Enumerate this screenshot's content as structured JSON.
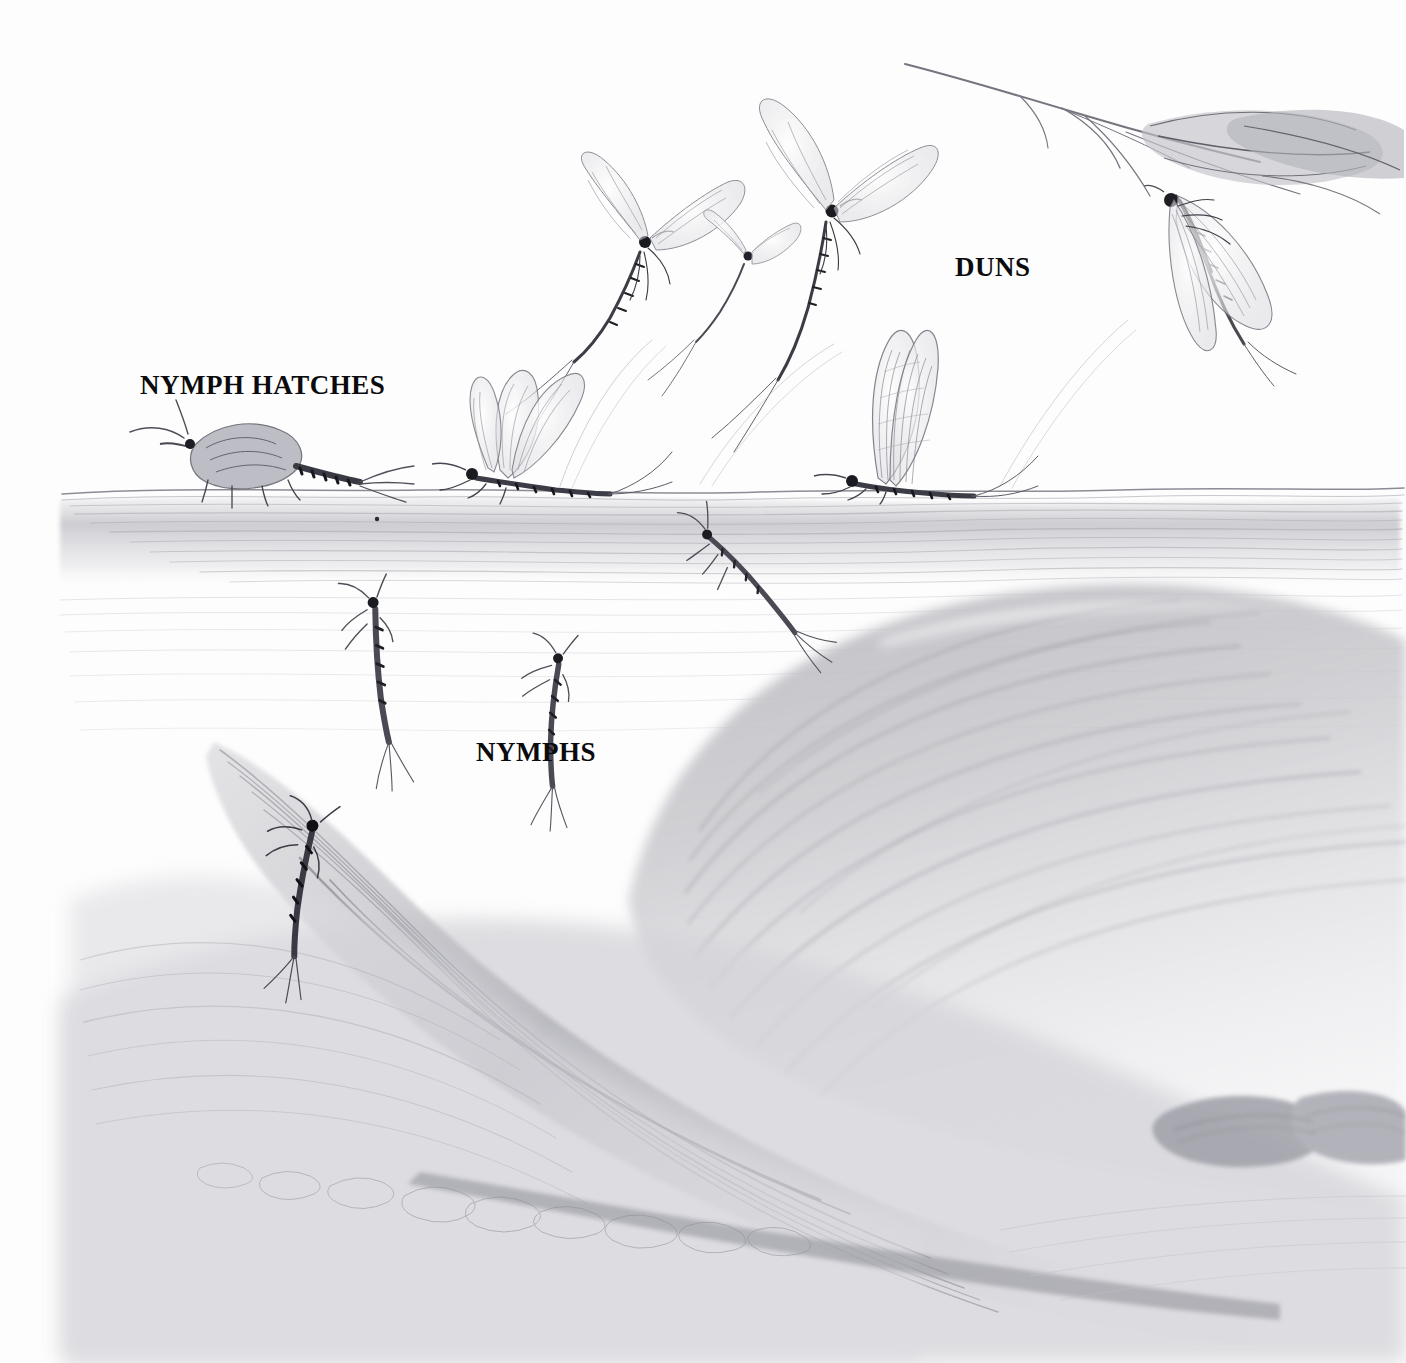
{
  "illustration": {
    "title": "Mayfly hatch cycle pencil illustration",
    "medium": "graphite pencil drawing",
    "background_color": "#fdfdfd",
    "ink_color": "#3a3a3e",
    "graphite_light": "#c9c9cd",
    "graphite_mid": "#a6a6ac",
    "graphite_dark": "#6f6f76"
  },
  "labels": [
    {
      "id": "nymph-hatches",
      "text": "NYMPH HATCHES",
      "x": 140,
      "y": 370,
      "size": 27
    },
    {
      "id": "duns",
      "text": "DUNS",
      "x": 955,
      "y": 252,
      "size": 27
    },
    {
      "id": "nymphs",
      "text": "NYMPHS",
      "x": 476,
      "y": 737,
      "size": 27
    }
  ],
  "scene": {
    "water_surface_y": 492,
    "regions": [
      {
        "name": "sky-above-water",
        "y_from": 0,
        "y_to": 492
      },
      {
        "name": "water-column",
        "y_from": 492,
        "y_to": 1363
      }
    ]
  },
  "subjects": [
    {
      "id": "emerging-nymph-shuck",
      "label": "nymph hatching at surface",
      "x": 130,
      "y": 415,
      "w": 250,
      "h": 85
    },
    {
      "id": "emerging-dun-left",
      "label": "dun emerging from shuck",
      "x": 430,
      "y": 370,
      "w": 190,
      "h": 125
    },
    {
      "id": "dun-on-surface-right",
      "label": "dun riding the surface",
      "x": 830,
      "y": 325,
      "w": 170,
      "h": 170
    },
    {
      "id": "flying-dun-low",
      "label": "flying dun rising",
      "x": 560,
      "y": 180,
      "w": 150,
      "h": 150
    },
    {
      "id": "flying-dun-small",
      "label": "small flying dun",
      "x": 700,
      "y": 240,
      "w": 80,
      "h": 70
    },
    {
      "id": "flying-dun-high",
      "label": "flying dun climbing",
      "x": 755,
      "y": 100,
      "w": 175,
      "h": 160
    },
    {
      "id": "perched-dun-branch",
      "label": "dun perched under willow branch",
      "x": 1140,
      "y": 150,
      "w": 200,
      "h": 215
    },
    {
      "id": "willow-branch",
      "label": "willow branch with leaves",
      "x": 905,
      "y": 62,
      "w": 500,
      "h": 140
    },
    {
      "id": "nymph-swimming-upper",
      "label": "nymph swimming up",
      "x": 700,
      "y": 515,
      "w": 130,
      "h": 75
    },
    {
      "id": "nymph-swimming-left",
      "label": "nymph swimming",
      "x": 350,
      "y": 585,
      "w": 75,
      "h": 130
    },
    {
      "id": "nymph-swimming-mid",
      "label": "nymph swimming",
      "x": 540,
      "y": 640,
      "w": 90,
      "h": 105
    },
    {
      "id": "nymph-on-stick",
      "label": "nymph clinging to sunken stick",
      "x": 300,
      "y": 800,
      "w": 120,
      "h": 110
    },
    {
      "id": "sunken-stick",
      "label": "sunken stick / driftwood",
      "x": 80,
      "y": 735,
      "w": 900,
      "h": 500
    },
    {
      "id": "large-boulder",
      "label": "submerged boulder",
      "x": 620,
      "y": 595,
      "w": 790,
      "h": 560
    },
    {
      "id": "streambed-pebbles",
      "label": "streambed pebbles",
      "x": 200,
      "y": 1130,
      "w": 700,
      "h": 110
    },
    {
      "id": "dark-pebbles-right",
      "label": "dark pebbles",
      "x": 1160,
      "y": 1080,
      "w": 250,
      "h": 110
    }
  ]
}
